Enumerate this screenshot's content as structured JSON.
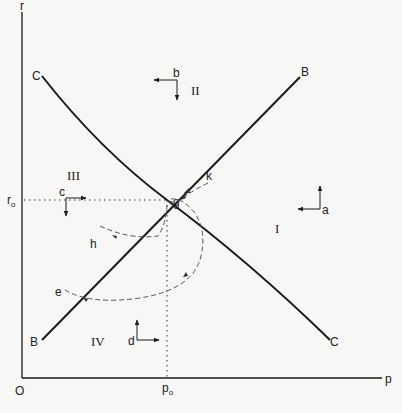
{
  "diagram": {
    "axes": {
      "y_label": "r",
      "x_label": "p",
      "origin_label": "O",
      "r0_label": "r",
      "r0_sub": "o",
      "p0_label": "p",
      "p0_sub": "o"
    },
    "curves": [
      {
        "name": "C",
        "start_label": "C",
        "end_label": "C",
        "description": "downward sloping curve"
      },
      {
        "name": "B",
        "start_label": "B",
        "end_label": "B",
        "description": "upward sloping line"
      }
    ],
    "equilibrium": {
      "label": "g"
    },
    "regions": [
      {
        "numeral": "I",
        "arrow_label": "a"
      },
      {
        "numeral": "II",
        "arrow_label": "b"
      },
      {
        "numeral": "III",
        "arrow_label": "c"
      },
      {
        "numeral": "IV",
        "arrow_label": "d"
      }
    ],
    "paths": [
      {
        "label": "k"
      },
      {
        "label": "h"
      },
      {
        "label": "e"
      }
    ],
    "colors": {
      "ink": "#1a1a1a",
      "paper": "#f7f7f5",
      "dashed": "#555555"
    }
  }
}
